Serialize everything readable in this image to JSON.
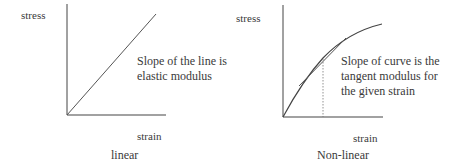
{
  "panels": [
    {
      "id": "linear",
      "caption": "linear",
      "y_label": "stress",
      "x_label": "strain",
      "annotation_line1": "Slope of the line is",
      "annotation_line2": "elastic modulus"
    },
    {
      "id": "non-linear",
      "caption": "Non-linear",
      "y_label": "stress",
      "x_label": "strain",
      "annotation_line1": "Slope of curve is the",
      "annotation_line2": "tangent modulus for",
      "annotation_line3": "the given strain"
    }
  ],
  "colors": {
    "line": "#444444",
    "text": "#3a3a3a"
  }
}
